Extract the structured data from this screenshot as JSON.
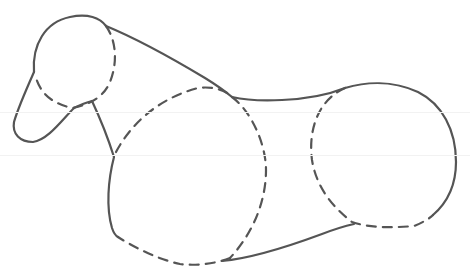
{
  "figure": {
    "stroke_color": "#555555",
    "background": "#ffffff",
    "parts": [
      {
        "name": "head",
        "style": "solid+dashed"
      },
      {
        "name": "snout",
        "style": "solid"
      },
      {
        "name": "neck",
        "style": "solid"
      },
      {
        "name": "front-body-circle",
        "style": "dashed+solid"
      },
      {
        "name": "back-line",
        "style": "solid"
      },
      {
        "name": "rear-body-circle",
        "style": "solid+dashed"
      },
      {
        "name": "belly-line",
        "style": "solid"
      }
    ]
  }
}
